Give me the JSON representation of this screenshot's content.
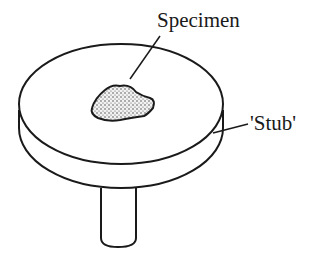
{
  "diagram": {
    "labels": {
      "specimen": "Specimen",
      "stub": "'Stub'"
    },
    "colors": {
      "stroke": "#1a1a1a",
      "specimen_fill": "#d8d8d8",
      "background": "#ffffff"
    }
  }
}
